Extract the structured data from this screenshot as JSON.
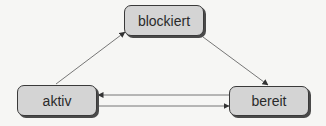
{
  "diagram": {
    "type": "state-transition",
    "nodes": [
      {
        "id": "blockiert",
        "label": "blockiert"
      },
      {
        "id": "aktiv",
        "label": "aktiv"
      },
      {
        "id": "bereit",
        "label": "bereit"
      }
    ],
    "edges": [
      {
        "from": "aktiv",
        "to": "blockiert"
      },
      {
        "from": "blockiert",
        "to": "bereit"
      },
      {
        "from": "bereit",
        "to": "aktiv"
      },
      {
        "from": "aktiv",
        "to": "bereit"
      }
    ],
    "colors": {
      "node_fill": "#d4d4d4",
      "node_border": "#3a3a3a",
      "edge": "#555555",
      "background": "#f6f6f4"
    }
  }
}
